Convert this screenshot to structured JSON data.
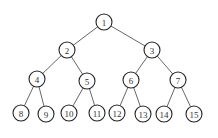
{
  "diagram": {
    "type": "binary-tree",
    "radius": 8,
    "nodes": [
      {
        "id": "1",
        "label": "1",
        "x": 104,
        "y": 22
      },
      {
        "id": "2",
        "label": "2",
        "x": 67,
        "y": 50
      },
      {
        "id": "3",
        "label": "3",
        "x": 152,
        "y": 50
      },
      {
        "id": "4",
        "label": "4",
        "x": 37,
        "y": 79
      },
      {
        "id": "5",
        "label": "5",
        "x": 87,
        "y": 81
      },
      {
        "id": "6",
        "label": "6",
        "x": 131,
        "y": 80
      },
      {
        "id": "7",
        "label": "7",
        "x": 178,
        "y": 80
      },
      {
        "id": "8",
        "label": "8",
        "x": 21,
        "y": 113
      },
      {
        "id": "9",
        "label": "9",
        "x": 46,
        "y": 114
      },
      {
        "id": "10",
        "label": "10",
        "x": 69,
        "y": 113
      },
      {
        "id": "11",
        "label": "11",
        "x": 97,
        "y": 113
      },
      {
        "id": "12",
        "label": "12",
        "x": 117,
        "y": 113
      },
      {
        "id": "13",
        "label": "13",
        "x": 143,
        "y": 114
      },
      {
        "id": "14",
        "label": "14",
        "x": 164,
        "y": 114
      },
      {
        "id": "15",
        "label": "15",
        "x": 194,
        "y": 114
      }
    ],
    "edges": [
      [
        "1",
        "2"
      ],
      [
        "1",
        "3"
      ],
      [
        "2",
        "4"
      ],
      [
        "2",
        "5"
      ],
      [
        "3",
        "6"
      ],
      [
        "3",
        "7"
      ],
      [
        "4",
        "8"
      ],
      [
        "4",
        "9"
      ],
      [
        "5",
        "10"
      ],
      [
        "5",
        "11"
      ],
      [
        "6",
        "12"
      ],
      [
        "6",
        "13"
      ],
      [
        "7",
        "14"
      ],
      [
        "7",
        "15"
      ]
    ]
  }
}
